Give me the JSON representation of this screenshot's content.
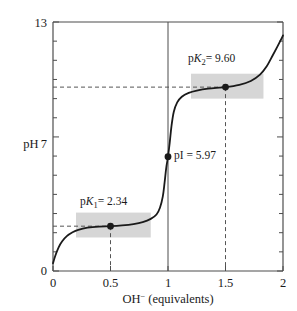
{
  "chart_data": {
    "type": "line",
    "title": "",
    "xlabel": "OH⁻ (equivalents)",
    "ylabel": "pH",
    "xlim": [
      0,
      2
    ],
    "ylim": [
      0,
      13
    ],
    "grid": false,
    "legend": "none",
    "x_ticks": [
      "0",
      "0.5",
      "1",
      "1.5",
      "2"
    ],
    "x_tick_values": [
      0,
      0.5,
      1,
      1.5,
      2
    ],
    "y_ticks": [
      "0",
      "7",
      "13"
    ],
    "y_tick_values": [
      0,
      7,
      13
    ],
    "y_minor_tick_values": [
      1,
      2,
      3,
      4,
      5,
      6,
      8,
      9,
      10,
      11,
      12
    ],
    "series": [
      {
        "name": "Titration curve",
        "color": "#1a1a1a",
        "points": [
          [
            0.0,
            0.4
          ],
          [
            0.02,
            0.8
          ],
          [
            0.05,
            1.25
          ],
          [
            0.08,
            1.55
          ],
          [
            0.12,
            1.82
          ],
          [
            0.17,
            2.02
          ],
          [
            0.22,
            2.15
          ],
          [
            0.3,
            2.26
          ],
          [
            0.4,
            2.32
          ],
          [
            0.5,
            2.34
          ],
          [
            0.6,
            2.38
          ],
          [
            0.7,
            2.45
          ],
          [
            0.78,
            2.55
          ],
          [
            0.85,
            2.72
          ],
          [
            0.9,
            2.95
          ],
          [
            0.93,
            3.3
          ],
          [
            0.955,
            3.9
          ],
          [
            0.97,
            4.6
          ],
          [
            0.985,
            5.4
          ],
          [
            1.0,
            5.97
          ],
          [
            1.015,
            6.7
          ],
          [
            1.03,
            7.55
          ],
          [
            1.05,
            8.3
          ],
          [
            1.08,
            8.8
          ],
          [
            1.12,
            9.1
          ],
          [
            1.18,
            9.3
          ],
          [
            1.25,
            9.42
          ],
          [
            1.35,
            9.52
          ],
          [
            1.5,
            9.6
          ],
          [
            1.62,
            9.72
          ],
          [
            1.72,
            9.92
          ],
          [
            1.8,
            10.25
          ],
          [
            1.86,
            10.7
          ],
          [
            1.91,
            11.25
          ],
          [
            1.95,
            11.7
          ],
          [
            1.98,
            12.05
          ],
          [
            2.0,
            12.3
          ]
        ]
      }
    ],
    "markers": [
      {
        "name": "pK1",
        "x": 0.5,
        "y": 2.34,
        "label": "pK",
        "sub": "1",
        "value": "= 2.34"
      },
      {
        "name": "pI",
        "x": 1.0,
        "y": 5.97,
        "label": "pI",
        "sub": "",
        "value": "= 5.97"
      },
      {
        "name": "pK2",
        "x": 1.5,
        "y": 9.6,
        "label": "pK",
        "sub": "2",
        "value": "= 9.60"
      }
    ],
    "buffer_regions": [
      {
        "name": "pK1-buffer-zone",
        "x0": 0.2,
        "x1": 0.85,
        "y0": 1.75,
        "y1": 3.05,
        "color": "#d6d6d6"
      },
      {
        "name": "pK2-buffer-zone",
        "x0": 1.2,
        "x1": 1.83,
        "y0": 9.0,
        "y1": 10.3,
        "color": "#d6d6d6"
      }
    ],
    "guides": {
      "equivalence_line_x": 1.0,
      "dashed_horizontal_levels": [
        2.34,
        9.6
      ],
      "dashed_vertical_positions": [
        0.5,
        1.5
      ]
    },
    "colors": {
      "axis": "#4d4d4d",
      "curve": "#1a1a1a",
      "shade": "#d6d6d6",
      "dash": "#555555",
      "background": "#ffffff"
    }
  },
  "labels": {
    "y_axis_title": "pH",
    "x_axis_title_main": "OH",
    "x_axis_title_sup": "−",
    "x_axis_title_rest": "(equivalents)",
    "pk1_text": "p",
    "pk1_italic": "K",
    "pk1_sub": "1",
    "pk1_value": "= 2.34",
    "pk2_text": "p",
    "pk2_italic": "K",
    "pk2_sub": "2",
    "pk2_value": "= 9.60",
    "pi_text": "pI",
    "pi_value": "= 5.97",
    "t0": "0",
    "t05": "0.5",
    "t1": "1",
    "t15": "1.5",
    "t2": "2",
    "y0": "0",
    "y7": "7",
    "y13": "13"
  }
}
